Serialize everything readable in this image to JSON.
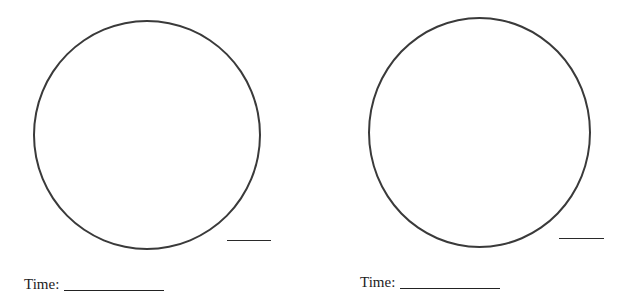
{
  "worksheet": {
    "panels": [
      {
        "time_label": "Time:",
        "time_value": ""
      },
      {
        "time_label": "Time:",
        "time_value": ""
      }
    ]
  }
}
